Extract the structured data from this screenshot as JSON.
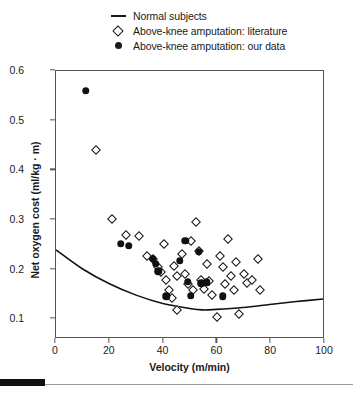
{
  "legend": {
    "items": [
      {
        "label": "Normal subjects",
        "marker": "line-marker"
      },
      {
        "label": "Above-knee amputation: literature",
        "marker": "open-diamond-marker"
      },
      {
        "label": "Above-knee amputation: our data",
        "marker": "filled-circle-marker"
      }
    ]
  },
  "chart_data": {
    "type": "scatter",
    "title": "",
    "xlabel": "Velocity (m/min)",
    "ylabel": "Net oxygen cost (ml/kg · m)",
    "xlim": [
      0,
      100
    ],
    "ylim": [
      0.06,
      0.6
    ],
    "xticks": [
      0,
      20,
      40,
      60,
      80,
      100
    ],
    "yticks": [
      0.1,
      0.2,
      0.3,
      0.4,
      0.5,
      0.6
    ],
    "xtick_labels": [
      "0",
      "20",
      "40",
      "60",
      "80",
      "100"
    ],
    "ytick_labels": [
      "0.1",
      "0.2",
      "0.3",
      "0.4",
      "0.5",
      "0.6"
    ],
    "grid": false,
    "legend_position": "top-center",
    "series": [
      {
        "name": "Normal subjects",
        "type": "line",
        "marker": "none",
        "color": "#111111",
        "points": [
          {
            "x": 0,
            "y": 0.237
          },
          {
            "x": 10,
            "y": 0.198
          },
          {
            "x": 20,
            "y": 0.168
          },
          {
            "x": 30,
            "y": 0.145
          },
          {
            "x": 40,
            "y": 0.128
          },
          {
            "x": 50,
            "y": 0.118
          },
          {
            "x": 55,
            "y": 0.115
          },
          {
            "x": 60,
            "y": 0.116
          },
          {
            "x": 70,
            "y": 0.12
          },
          {
            "x": 80,
            "y": 0.126
          },
          {
            "x": 90,
            "y": 0.132
          },
          {
            "x": 100,
            "y": 0.137
          }
        ]
      },
      {
        "name": "Above-knee amputation: literature",
        "type": "scatter",
        "marker": "open-diamond",
        "color": "#111111",
        "points": [
          {
            "x": 15,
            "y": 0.44
          },
          {
            "x": 21,
            "y": 0.302
          },
          {
            "x": 26,
            "y": 0.27
          },
          {
            "x": 31,
            "y": 0.267
          },
          {
            "x": 34,
            "y": 0.228
          },
          {
            "x": 36,
            "y": 0.222
          },
          {
            "x": 38,
            "y": 0.205
          },
          {
            "x": 39,
            "y": 0.196
          },
          {
            "x": 40,
            "y": 0.252
          },
          {
            "x": 41,
            "y": 0.178
          },
          {
            "x": 42,
            "y": 0.158
          },
          {
            "x": 43,
            "y": 0.143
          },
          {
            "x": 44,
            "y": 0.208
          },
          {
            "x": 45,
            "y": 0.186
          },
          {
            "x": 45,
            "y": 0.118
          },
          {
            "x": 47,
            "y": 0.232
          },
          {
            "x": 48,
            "y": 0.19
          },
          {
            "x": 49,
            "y": 0.17
          },
          {
            "x": 50,
            "y": 0.258
          },
          {
            "x": 51,
            "y": 0.158
          },
          {
            "x": 52,
            "y": 0.296
          },
          {
            "x": 53,
            "y": 0.238
          },
          {
            "x": 54,
            "y": 0.178
          },
          {
            "x": 55,
            "y": 0.16
          },
          {
            "x": 56,
            "y": 0.212
          },
          {
            "x": 57,
            "y": 0.176
          },
          {
            "x": 58,
            "y": 0.148
          },
          {
            "x": 60,
            "y": 0.104
          },
          {
            "x": 61,
            "y": 0.228
          },
          {
            "x": 62,
            "y": 0.205
          },
          {
            "x": 63,
            "y": 0.17
          },
          {
            "x": 64,
            "y": 0.262
          },
          {
            "x": 65,
            "y": 0.186
          },
          {
            "x": 66,
            "y": 0.158
          },
          {
            "x": 67,
            "y": 0.215
          },
          {
            "x": 68,
            "y": 0.11
          },
          {
            "x": 70,
            "y": 0.19
          },
          {
            "x": 71,
            "y": 0.172
          },
          {
            "x": 73,
            "y": 0.178
          },
          {
            "x": 75,
            "y": 0.222
          },
          {
            "x": 76,
            "y": 0.158
          }
        ]
      },
      {
        "name": "Above-knee amputation: our data",
        "type": "scatter",
        "marker": "filled-circle",
        "color": "#111111",
        "points": [
          {
            "x": 11,
            "y": 0.56
          },
          {
            "x": 24,
            "y": 0.252
          },
          {
            "x": 27,
            "y": 0.248
          },
          {
            "x": 36,
            "y": 0.222
          },
          {
            "x": 37,
            "y": 0.212
          },
          {
            "x": 38,
            "y": 0.197
          },
          {
            "x": 41,
            "y": 0.146
          },
          {
            "x": 46,
            "y": 0.218
          },
          {
            "x": 48,
            "y": 0.258
          },
          {
            "x": 49,
            "y": 0.175
          },
          {
            "x": 50,
            "y": 0.147
          },
          {
            "x": 53,
            "y": 0.236
          },
          {
            "x": 54,
            "y": 0.172
          },
          {
            "x": 56,
            "y": 0.174
          },
          {
            "x": 62,
            "y": 0.146
          }
        ]
      }
    ]
  }
}
